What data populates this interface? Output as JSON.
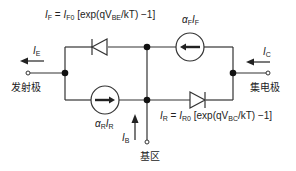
{
  "diagram": {
    "equations": {
      "forward": {
        "lhs": "I",
        "lhs_sub": "F",
        "eq": " = ",
        "i0": "I",
        "i0_sub": "F0",
        "open": " [exp(qV",
        "v_sub": "BE",
        "close": "/kT) −1]"
      },
      "reverse": {
        "lhs": "I",
        "lhs_sub": "R",
        "eq": " = ",
        "i0": "I",
        "i0_sub": "R0",
        "open": " [exp(qV",
        "v_sub": "BC",
        "close": "/kT) −1]"
      }
    },
    "sources": {
      "forward": {
        "alpha": "α",
        "alpha_sub": "F",
        "i": "I",
        "i_sub": "F"
      },
      "reverse": {
        "alpha": "α",
        "alpha_sub": "R",
        "i": "I",
        "i_sub": "R"
      }
    },
    "currents": {
      "emitter": {
        "sym": "I",
        "sub": "E"
      },
      "collector": {
        "sym": "I",
        "sub": "C"
      },
      "base": {
        "sym": "I",
        "sub": "B"
      }
    },
    "terminals": {
      "emitter": "发射极",
      "collector": "集电极",
      "base": "基区"
    },
    "colors": {
      "line": "#333333",
      "background": "#ffffff"
    }
  }
}
